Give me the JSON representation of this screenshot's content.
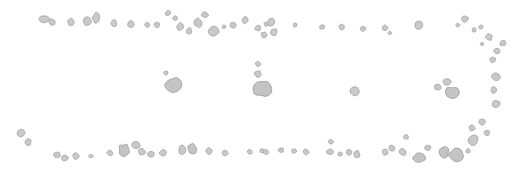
{
  "canvas": {
    "width": 523,
    "height": 173,
    "background_color": "#ffffff",
    "title": "scattered gray particle distribution"
  },
  "style": {
    "fill_color": "#c9c9c9",
    "stroke_color": "#a6a6a6",
    "stroke_width": 0.9,
    "large_fill_color": "#c4c4c4",
    "large_stroke_color": "#9e9e9e"
  },
  "groups": [
    {
      "id": "top-band",
      "name": "top-band",
      "label": "upper scatter band"
    },
    {
      "id": "middle-band",
      "name": "middle-band",
      "label": "middle sparse band"
    },
    {
      "id": "bottom-band",
      "name": "bottom-band",
      "label": "lower scatter band"
    },
    {
      "id": "right-arc",
      "name": "right-arc",
      "label": "right descending arc"
    }
  ],
  "blobs": [
    {
      "group": "top-band",
      "cx": 44,
      "cy": 19,
      "rx": 5.2,
      "ry": 3.6,
      "rot": 28,
      "seed": 3
    },
    {
      "group": "top-band",
      "cx": 52,
      "cy": 22,
      "rx": 3.6,
      "ry": 3.0,
      "rot": 12,
      "seed": 7
    },
    {
      "group": "top-band",
      "cx": 71,
      "cy": 22,
      "rx": 3.2,
      "ry": 3.6,
      "rot": 40,
      "seed": 11
    },
    {
      "group": "top-band",
      "cx": 87,
      "cy": 21,
      "rx": 4.2,
      "ry": 4.2,
      "rot": 0,
      "seed": 2
    },
    {
      "group": "top-band",
      "cx": 96,
      "cy": 18,
      "rx": 3.6,
      "ry": 5.0,
      "rot": 24,
      "seed": 5
    },
    {
      "group": "top-band",
      "cx": 114,
      "cy": 23,
      "rx": 3.0,
      "ry": 3.4,
      "rot": 10,
      "seed": 9
    },
    {
      "group": "top-band",
      "cx": 131,
      "cy": 24,
      "rx": 3.6,
      "ry": 3.2,
      "rot": 32,
      "seed": 13
    },
    {
      "group": "top-band",
      "cx": 147,
      "cy": 25,
      "rx": 2.6,
      "ry": 2.4,
      "rot": 6,
      "seed": 4
    },
    {
      "group": "top-band",
      "cx": 157,
      "cy": 25,
      "rx": 2.8,
      "ry": 2.6,
      "rot": 18,
      "seed": 8
    },
    {
      "group": "top-band",
      "cx": 168,
      "cy": 13,
      "rx": 2.6,
      "ry": 2.8,
      "rot": 22,
      "seed": 12
    },
    {
      "group": "top-band",
      "cx": 175,
      "cy": 18,
      "rx": 2.4,
      "ry": 2.2,
      "rot": 0,
      "seed": 6
    },
    {
      "group": "top-band",
      "cx": 180,
      "cy": 27,
      "rx": 3.4,
      "ry": 4.0,
      "rot": 36,
      "seed": 1
    },
    {
      "group": "top-band",
      "cx": 189,
      "cy": 31,
      "rx": 3.0,
      "ry": 3.4,
      "rot": 14,
      "seed": 10
    },
    {
      "group": "top-band",
      "cx": 198,
      "cy": 23,
      "rx": 3.8,
      "ry": 4.6,
      "rot": 30,
      "seed": 15
    },
    {
      "group": "top-band",
      "cx": 205,
      "cy": 15,
      "rx": 3.4,
      "ry": 3.0,
      "rot": 8,
      "seed": 14
    },
    {
      "group": "top-band",
      "cx": 214,
      "cy": 31,
      "rx": 5.6,
      "ry": 5.2,
      "rot": 20,
      "seed": 16
    },
    {
      "group": "top-band",
      "cx": 224,
      "cy": 27,
      "rx": 2.0,
      "ry": 1.8,
      "rot": 0,
      "seed": 17
    },
    {
      "group": "top-band",
      "cx": 233,
      "cy": 25,
      "rx": 3.2,
      "ry": 3.0,
      "rot": 26,
      "seed": 18
    },
    {
      "group": "top-band",
      "cx": 245,
      "cy": 20,
      "rx": 3.0,
      "ry": 3.4,
      "rot": 12,
      "seed": 19
    },
    {
      "group": "top-band",
      "cx": 258,
      "cy": 28,
      "rx": 3.0,
      "ry": 2.8,
      "rot": 34,
      "seed": 20
    },
    {
      "group": "top-band",
      "cx": 266,
      "cy": 24,
      "rx": 2.2,
      "ry": 2.0,
      "rot": 0,
      "seed": 21
    },
    {
      "group": "top-band",
      "cx": 271,
      "cy": 22,
      "rx": 4.0,
      "ry": 4.4,
      "rot": 18,
      "seed": 22
    },
    {
      "group": "top-band",
      "cx": 274,
      "cy": 32,
      "rx": 3.6,
      "ry": 3.4,
      "rot": 28,
      "seed": 23
    },
    {
      "group": "top-band",
      "cx": 264,
      "cy": 35,
      "rx": 3.0,
      "ry": 3.2,
      "rot": 10,
      "seed": 24
    },
    {
      "group": "top-band",
      "cx": 295,
      "cy": 25,
      "rx": 2.2,
      "ry": 2.0,
      "rot": 0,
      "seed": 25
    },
    {
      "group": "top-band",
      "cx": 322,
      "cy": 27,
      "rx": 2.6,
      "ry": 2.4,
      "rot": 16,
      "seed": 26
    },
    {
      "group": "top-band",
      "cx": 342,
      "cy": 27,
      "rx": 3.0,
      "ry": 2.8,
      "rot": 24,
      "seed": 27
    },
    {
      "group": "top-band",
      "cx": 363,
      "cy": 29,
      "rx": 2.8,
      "ry": 2.6,
      "rot": 8,
      "seed": 28
    },
    {
      "group": "top-band",
      "cx": 385,
      "cy": 28,
      "rx": 2.8,
      "ry": 3.0,
      "rot": 30,
      "seed": 29
    },
    {
      "group": "top-band",
      "cx": 390,
      "cy": 33,
      "rx": 2.0,
      "ry": 1.8,
      "rot": 0,
      "seed": 30
    },
    {
      "group": "top-band",
      "cx": 419,
      "cy": 25,
      "rx": 4.2,
      "ry": 4.0,
      "rot": 20,
      "seed": 31
    },
    {
      "group": "right-arc",
      "cx": 465,
      "cy": 19,
      "rx": 3.2,
      "ry": 3.6,
      "rot": 22,
      "seed": 32
    },
    {
      "group": "right-arc",
      "cx": 458,
      "cy": 25,
      "rx": 2.0,
      "ry": 1.8,
      "rot": 0,
      "seed": 33
    },
    {
      "group": "right-arc",
      "cx": 474,
      "cy": 30,
      "rx": 2.0,
      "ry": 2.2,
      "rot": 12,
      "seed": 34
    },
    {
      "group": "right-arc",
      "cx": 481,
      "cy": 27,
      "rx": 2.4,
      "ry": 2.2,
      "rot": 28,
      "seed": 35
    },
    {
      "group": "right-arc",
      "cx": 489,
      "cy": 37,
      "rx": 3.6,
      "ry": 3.4,
      "rot": 16,
      "seed": 36
    },
    {
      "group": "right-arc",
      "cx": 482,
      "cy": 44,
      "rx": 2.0,
      "ry": 1.8,
      "rot": 0,
      "seed": 37
    },
    {
      "group": "right-arc",
      "cx": 503,
      "cy": 43,
      "rx": 3.2,
      "ry": 3.0,
      "rot": 24,
      "seed": 38
    },
    {
      "group": "right-arc",
      "cx": 497,
      "cy": 51,
      "rx": 3.0,
      "ry": 2.8,
      "rot": 10,
      "seed": 39
    },
    {
      "group": "middle-band",
      "cx": 166,
      "cy": 73,
      "rx": 2.4,
      "ry": 2.2,
      "rot": 0,
      "seed": 40
    },
    {
      "group": "middle-band",
      "cx": 173,
      "cy": 85,
      "rx": 8.0,
      "ry": 7.6,
      "rot": 18,
      "seed": 41
    },
    {
      "group": "middle-band",
      "cx": 258,
      "cy": 64,
      "rx": 2.8,
      "ry": 2.6,
      "rot": 0,
      "seed": 42
    },
    {
      "group": "middle-band",
      "cx": 258,
      "cy": 74,
      "rx": 3.4,
      "ry": 3.2,
      "rot": 14,
      "seed": 43
    },
    {
      "group": "middle-band",
      "cx": 263,
      "cy": 89,
      "rx": 9.0,
      "ry": 8.4,
      "rot": 26,
      "seed": 44
    },
    {
      "group": "middle-band",
      "cx": 355,
      "cy": 91,
      "rx": 4.6,
      "ry": 4.4,
      "rot": 12,
      "seed": 45
    },
    {
      "group": "middle-band",
      "cx": 438,
      "cy": 87,
      "rx": 3.4,
      "ry": 3.2,
      "rot": 20,
      "seed": 46
    },
    {
      "group": "middle-band",
      "cx": 447,
      "cy": 82,
      "rx": 3.8,
      "ry": 3.6,
      "rot": 8,
      "seed": 47
    },
    {
      "group": "middle-band",
      "cx": 452,
      "cy": 93,
      "rx": 7.4,
      "ry": 6.6,
      "rot": 30,
      "seed": 48
    },
    {
      "group": "middle-band",
      "cx": 496,
      "cy": 77,
      "rx": 4.0,
      "ry": 3.8,
      "rot": 16,
      "seed": 49
    },
    {
      "group": "middle-band",
      "cx": 494,
      "cy": 90,
      "rx": 3.0,
      "ry": 3.4,
      "rot": 22,
      "seed": 50
    },
    {
      "group": "middle-band",
      "cx": 496,
      "cy": 104,
      "rx": 4.0,
      "ry": 3.8,
      "rot": 6,
      "seed": 51
    },
    {
      "group": "middle-band",
      "cx": 493,
      "cy": 60,
      "rx": 3.0,
      "ry": 2.8,
      "rot": 0,
      "seed": 52
    },
    {
      "group": "bottom-band",
      "cx": 21,
      "cy": 133,
      "rx": 4.2,
      "ry": 4.0,
      "rot": 24,
      "seed": 53
    },
    {
      "group": "bottom-band",
      "cx": 28,
      "cy": 142,
      "rx": 3.4,
      "ry": 3.2,
      "rot": 10,
      "seed": 54
    },
    {
      "group": "bottom-band",
      "cx": 57,
      "cy": 155,
      "rx": 3.4,
      "ry": 3.2,
      "rot": 18,
      "seed": 55
    },
    {
      "group": "bottom-band",
      "cx": 65,
      "cy": 158,
      "rx": 3.6,
      "ry": 3.0,
      "rot": 30,
      "seed": 56
    },
    {
      "group": "bottom-band",
      "cx": 76,
      "cy": 156,
      "rx": 3.2,
      "ry": 3.0,
      "rot": 6,
      "seed": 57
    },
    {
      "group": "bottom-band",
      "cx": 91,
      "cy": 156,
      "rx": 2.2,
      "ry": 2.0,
      "rot": 0,
      "seed": 58
    },
    {
      "group": "bottom-band",
      "cx": 110,
      "cy": 153,
      "rx": 3.0,
      "ry": 2.8,
      "rot": 14,
      "seed": 59
    },
    {
      "group": "bottom-band",
      "cx": 124,
      "cy": 150,
      "rx": 5.4,
      "ry": 6.2,
      "rot": 20,
      "seed": 60
    },
    {
      "group": "bottom-band",
      "cx": 136,
      "cy": 145,
      "rx": 4.2,
      "ry": 3.4,
      "rot": 28,
      "seed": 61
    },
    {
      "group": "bottom-band",
      "cx": 142,
      "cy": 152,
      "rx": 3.8,
      "ry": 3.2,
      "rot": 8,
      "seed": 62
    },
    {
      "group": "bottom-band",
      "cx": 151,
      "cy": 154,
      "rx": 3.2,
      "ry": 3.0,
      "rot": 16,
      "seed": 63
    },
    {
      "group": "bottom-band",
      "cx": 163,
      "cy": 153,
      "rx": 3.4,
      "ry": 3.2,
      "rot": 22,
      "seed": 64
    },
    {
      "group": "bottom-band",
      "cx": 182,
      "cy": 150,
      "rx": 3.6,
      "ry": 4.6,
      "rot": 12,
      "seed": 65
    },
    {
      "group": "bottom-band",
      "cx": 192,
      "cy": 149,
      "rx": 4.2,
      "ry": 6.0,
      "rot": 4,
      "seed": 66
    },
    {
      "group": "bottom-band",
      "cx": 209,
      "cy": 151,
      "rx": 3.4,
      "ry": 3.2,
      "rot": 26,
      "seed": 67
    },
    {
      "group": "bottom-band",
      "cx": 225,
      "cy": 153,
      "rx": 3.4,
      "ry": 3.2,
      "rot": 10,
      "seed": 68
    },
    {
      "group": "bottom-band",
      "cx": 250,
      "cy": 152,
      "rx": 2.6,
      "ry": 2.4,
      "rot": 0,
      "seed": 69
    },
    {
      "group": "bottom-band",
      "cx": 262,
      "cy": 151,
      "rx": 2.4,
      "ry": 2.2,
      "rot": 0,
      "seed": 70
    },
    {
      "group": "bottom-band",
      "cx": 266,
      "cy": 152,
      "rx": 2.6,
      "ry": 2.4,
      "rot": 18,
      "seed": 71
    },
    {
      "group": "bottom-band",
      "cx": 281,
      "cy": 150,
      "rx": 2.8,
      "ry": 2.6,
      "rot": 8,
      "seed": 72
    },
    {
      "group": "bottom-band",
      "cx": 294,
      "cy": 151,
      "rx": 2.6,
      "ry": 2.4,
      "rot": 24,
      "seed": 73
    },
    {
      "group": "bottom-band",
      "cx": 306,
      "cy": 152,
      "rx": 2.8,
      "ry": 3.0,
      "rot": 14,
      "seed": 74
    },
    {
      "group": "bottom-band",
      "cx": 330,
      "cy": 152,
      "rx": 3.0,
      "ry": 2.8,
      "rot": 20,
      "seed": 75
    },
    {
      "group": "bottom-band",
      "cx": 331,
      "cy": 142,
      "rx": 2.6,
      "ry": 2.4,
      "rot": 0,
      "seed": 76
    },
    {
      "group": "bottom-band",
      "cx": 340,
      "cy": 154,
      "rx": 2.4,
      "ry": 2.2,
      "rot": 6,
      "seed": 77
    },
    {
      "group": "bottom-band",
      "cx": 349,
      "cy": 152,
      "rx": 3.0,
      "ry": 2.8,
      "rot": 16,
      "seed": 78
    },
    {
      "group": "bottom-band",
      "cx": 357,
      "cy": 154,
      "rx": 2.8,
      "ry": 3.8,
      "rot": 10,
      "seed": 79
    },
    {
      "group": "bottom-band",
      "cx": 385,
      "cy": 152,
      "rx": 3.0,
      "ry": 3.2,
      "rot": 28,
      "seed": 80
    },
    {
      "group": "bottom-band",
      "cx": 392,
      "cy": 148,
      "rx": 3.2,
      "ry": 3.0,
      "rot": 12,
      "seed": 81
    },
    {
      "group": "bottom-band",
      "cx": 406,
      "cy": 137,
      "rx": 2.6,
      "ry": 2.4,
      "rot": 0,
      "seed": 82
    },
    {
      "group": "bottom-band",
      "cx": 403,
      "cy": 152,
      "rx": 3.6,
      "ry": 3.4,
      "rot": 22,
      "seed": 83
    },
    {
      "group": "bottom-band",
      "cx": 419,
      "cy": 158,
      "rx": 6.0,
      "ry": 5.2,
      "rot": 16,
      "seed": 84
    },
    {
      "group": "bottom-band",
      "cx": 428,
      "cy": 148,
      "rx": 3.2,
      "ry": 3.0,
      "rot": 8,
      "seed": 85
    },
    {
      "group": "bottom-band",
      "cx": 444,
      "cy": 152,
      "rx": 4.6,
      "ry": 6.0,
      "rot": 14,
      "seed": 86
    },
    {
      "group": "bottom-band",
      "cx": 456,
      "cy": 155,
      "rx": 7.0,
      "ry": 6.4,
      "rot": 24,
      "seed": 87
    },
    {
      "group": "bottom-band",
      "cx": 473,
      "cy": 140,
      "rx": 5.2,
      "ry": 5.0,
      "rot": 18,
      "seed": 88
    },
    {
      "group": "bottom-band",
      "cx": 472,
      "cy": 128,
      "rx": 3.4,
      "ry": 3.2,
      "rot": 10,
      "seed": 89
    },
    {
      "group": "bottom-band",
      "cx": 482,
      "cy": 122,
      "rx": 3.2,
      "ry": 3.0,
      "rot": 26,
      "seed": 90
    },
    {
      "group": "bottom-band",
      "cx": 487,
      "cy": 133,
      "rx": 3.0,
      "ry": 2.8,
      "rot": 6,
      "seed": 91
    },
    {
      "group": "bottom-band",
      "cx": 468,
      "cy": 151,
      "rx": 2.4,
      "ry": 2.2,
      "rot": 0,
      "seed": 92
    }
  ]
}
